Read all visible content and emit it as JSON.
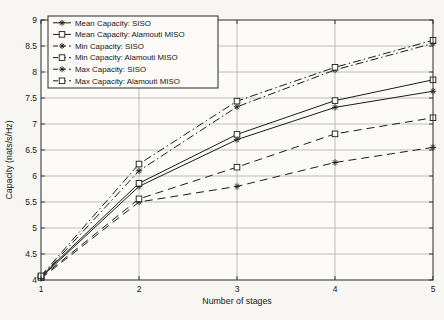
{
  "chart_data": {
    "type": "line",
    "title": "",
    "xlabel": "Number of stages",
    "ylabel": "Capacity (nats/s/Hz)",
    "xlim": [
      1,
      5
    ],
    "ylim": [
      4,
      9
    ],
    "xticks": [
      1,
      2,
      3,
      4,
      5
    ],
    "yticks": [
      4,
      4.5,
      5,
      5.5,
      6,
      6.5,
      7,
      7.5,
      8,
      8.5,
      9
    ],
    "grid": true,
    "legend_position": "top-left",
    "x": [
      1,
      2,
      3,
      4,
      5
    ],
    "series": [
      {
        "name": "Mean Capacity: SISO",
        "marker": "asterisk",
        "line_style": "solid",
        "values": [
          4.05,
          5.8,
          6.7,
          7.32,
          7.63
        ]
      },
      {
        "name": "Mean Capacity: Alamouti MISO",
        "marker": "square",
        "line_style": "solid",
        "values": [
          4.07,
          5.86,
          6.8,
          7.45,
          7.85
        ]
      },
      {
        "name": "Min Capacity: SISO",
        "marker": "asterisk",
        "line_style": "dashed",
        "values": [
          4.03,
          5.5,
          5.8,
          6.26,
          6.55
        ]
      },
      {
        "name": "Min Capacity: Alamouti MISO",
        "marker": "square",
        "line_style": "dashed",
        "values": [
          4.05,
          5.56,
          6.17,
          6.81,
          7.12
        ]
      },
      {
        "name": "Max Capacity: SISO",
        "marker": "asterisk",
        "line_style": "dashdot",
        "values": [
          4.06,
          6.1,
          7.33,
          8.04,
          8.55
        ]
      },
      {
        "name": "Max Capacity: Alamouti MISO",
        "marker": "square",
        "line_style": "dashdot",
        "values": [
          4.08,
          6.23,
          7.44,
          8.09,
          8.61
        ]
      }
    ],
    "colors": {
      "line": "#1c1c1c",
      "grid": "#a9a9a5",
      "axis": "#2a2a2a",
      "background": "#f7f6f2",
      "plot_background": "#fbfaf7",
      "legend_background": "#fbfaf7",
      "text": "#161616"
    }
  }
}
